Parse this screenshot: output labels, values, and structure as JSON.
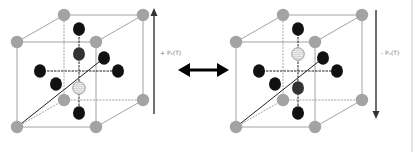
{
  "figure": {
    "left_cell": {
      "polarization_label": "+ Pₛ(T)",
      "polarization_direction": "up"
    },
    "right_cell": {
      "polarization_label": "- Pₛ(T)",
      "polarization_direction": "down"
    },
    "switch_arrow": "double-headed-arrow"
  },
  "colors": {
    "corner_atom": "#a3a3a3",
    "face_atom": "#111111",
    "displaced_face_atom": "#333333",
    "center_atom_fill": "#e6e6e6",
    "center_atom_stroke": "#888888",
    "cube_edge": "#8a8a8a",
    "axis_line": "#222222",
    "polarization_arrow": "#333333",
    "switch_arrow": "#000000"
  }
}
